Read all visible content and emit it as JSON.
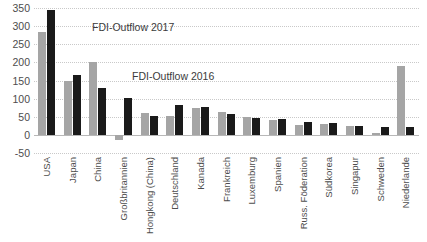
{
  "chart_data": {
    "type": "bar",
    "title": "",
    "subtitle": "",
    "xlabel": "",
    "ylabel": "",
    "ylim": [
      -50,
      350
    ],
    "ytick_step": 50,
    "yticks": [
      350,
      300,
      250,
      200,
      150,
      100,
      50,
      0,
      -50
    ],
    "ytick_labels": [
      "350",
      "300",
      "250",
      "200",
      "150",
      "100",
      "50",
      "0",
      "-50"
    ],
    "grid": true,
    "legend_position": "inline-annotation",
    "categories": [
      "USA",
      "Japan",
      "China",
      "Großbritannien",
      "Hongkong (China)",
      "Deutschland",
      "Kanada",
      "Frankreich",
      "Luxemburg",
      "Spanien",
      "Russ. Föderation",
      "Südkorea",
      "Singapur",
      "Schweden",
      "Niederlande"
    ],
    "series": [
      {
        "name": "FDI-Outflow 2016",
        "color": "#a5a5a5",
        "values": [
          285,
          150,
          200,
          -15,
          60,
          51,
          75,
          63,
          50,
          42,
          27,
          30,
          24,
          6,
          190
        ]
      },
      {
        "name": "FDI-Outflow 2017",
        "color": "#1a1a1a",
        "values": [
          345,
          165,
          130,
          103,
          53,
          82,
          77,
          58,
          47,
          44,
          36,
          32,
          25,
          22,
          23
        ]
      }
    ],
    "annotations": [
      {
        "text": "FDI-Outflow 2017",
        "series": "FDI-Outflow 2017"
      },
      {
        "text": "FDI-Outflow 2016",
        "series": "FDI-Outflow 2016"
      }
    ]
  }
}
